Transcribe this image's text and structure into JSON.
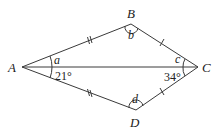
{
  "diagram": {
    "type": "kite-quadrilateral",
    "vertices": {
      "A": {
        "label": "A"
      },
      "B": {
        "label": "B"
      },
      "C": {
        "label": "C"
      },
      "D": {
        "label": "D"
      }
    },
    "angle_labels": {
      "a": "a",
      "b": "b",
      "c": "c",
      "d": "d",
      "angle_DAC": "21°",
      "angle_ACD": "34°"
    },
    "edges": [
      "AB",
      "BC",
      "CD",
      "DA",
      "AC"
    ],
    "equal_sides": {
      "double_tick": [
        "AB",
        "AD"
      ],
      "single_tick": [
        "BC",
        "DC"
      ]
    },
    "colors": {
      "stroke": "#3a3a3a",
      "text": "#222222",
      "background": "#ffffff"
    }
  }
}
